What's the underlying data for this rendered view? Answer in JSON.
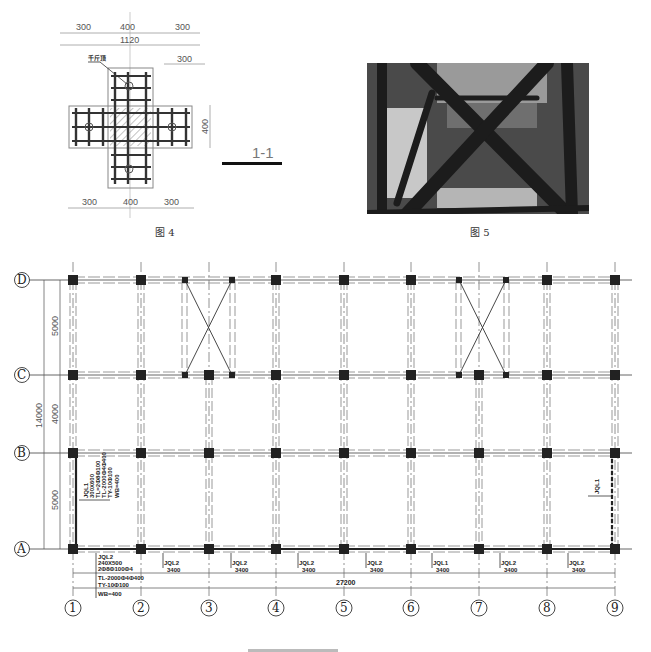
{
  "figure4": {
    "caption": "图 4",
    "section_label": "1-1",
    "leader_label": "千斤顶",
    "top_dims": [
      "300",
      "400",
      "300"
    ],
    "overall_dim": "1120",
    "right_top_dim": "300",
    "right_side_dim": "400",
    "bottom_dims": [
      "300",
      "400",
      "300"
    ]
  },
  "figure5": {
    "caption": "图 5",
    "description": "photo of timber cross-bracing shoring under slab"
  },
  "plan": {
    "row_axes": [
      "D",
      "C",
      "B",
      "A"
    ],
    "column_axes": [
      "1",
      "2",
      "3",
      "4",
      "5",
      "6",
      "7",
      "8",
      "9"
    ],
    "left_dims": [
      "5000",
      "4000",
      "5000"
    ],
    "left_overall_dim": "14000",
    "bottom_overall_dim": "27200",
    "bay_labels": [
      {
        "tag": "JQL2",
        "span": "3400"
      },
      {
        "tag": "JQL2",
        "span": "3400"
      },
      {
        "tag": "JQL2",
        "span": "3400"
      },
      {
        "tag": "JQL2",
        "span": "3400"
      },
      {
        "tag": "JQL1",
        "span": "3400"
      },
      {
        "tag": "JQL2",
        "span": "3400"
      },
      {
        "tag": "JQL2",
        "span": "3400"
      }
    ],
    "beam_note_a": [
      "JQL2",
      "240X500",
      "2Φ8Φ100Φ4",
      "TL-2000Φ4Φ400",
      "TY-10Φ100",
      "WB=400"
    ],
    "beam_note_b": [
      "JQL1",
      "300X600",
      "TL=2Φ8Φ100",
      "TL-2000Φ4Φ400",
      "TY-10Φ100",
      "WB=400"
    ],
    "right_note": "JQL1",
    "bottom_caption_clipped": ""
  }
}
